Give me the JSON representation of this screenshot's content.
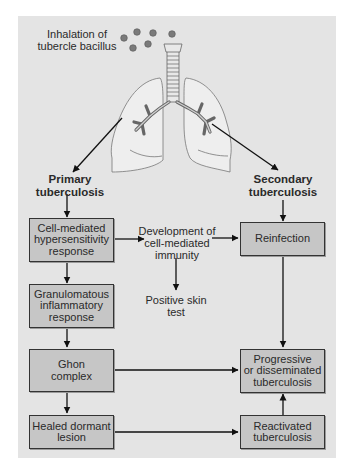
{
  "diagram": {
    "title_label": "Inhalation of\ntubercle bacillus",
    "branches": {
      "primary": "Primary\ntuberculosis",
      "secondary": "Secondary\ntuberculosis"
    },
    "nodes": {
      "cell_mediated": "Cell-mediated\nhypersensitivity\nresponse",
      "granulomatous": "Granulomatous\ninflammatory\nresponse",
      "ghon": "Ghon\ncomplex",
      "healed": "Healed dormant\nlesion",
      "reinfection": "Reinfection",
      "progressive": "Progressive\nor disseminated\ntuberculosis",
      "reactivated": "Reactivated\ntuberculosis"
    },
    "free_text": {
      "immunity": "Development of\ncell-mediated\nimmunity",
      "skin_test": "Positive skin\ntest"
    },
    "edges": [
      [
        "lungs",
        "primary"
      ],
      [
        "lungs",
        "secondary"
      ],
      [
        "primary",
        "cell_mediated"
      ],
      [
        "secondary",
        "reinfection"
      ],
      [
        "cell_mediated",
        "immunity"
      ],
      [
        "immunity",
        "reinfection"
      ],
      [
        "immunity",
        "skin_test"
      ],
      [
        "cell_mediated",
        "granulomatous"
      ],
      [
        "granulomatous",
        "ghon"
      ],
      [
        "ghon",
        "healed"
      ],
      [
        "ghon",
        "progressive"
      ],
      [
        "reinfection",
        "progressive"
      ],
      [
        "healed",
        "reactivated"
      ],
      [
        "reactivated",
        "progressive"
      ]
    ],
    "colors": {
      "panel": "#e4e4e4",
      "box_fill": "#c6c6c6",
      "lung_fill": "#eeeeee",
      "bacillus": "#7a7a7a",
      "stroke": "#222222"
    }
  }
}
